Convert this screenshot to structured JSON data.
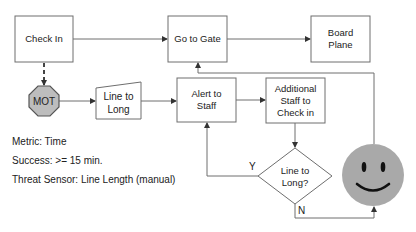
{
  "nodes": {
    "check_in": {
      "label": "Check In"
    },
    "go_to_gate": {
      "label": "Go to Gate"
    },
    "board_plane": {
      "line1": "Board",
      "line2": "Plane"
    },
    "mot": {
      "label": "MOT",
      "fill": "#bdbdbd"
    },
    "line_to_long": {
      "line1": "Line to",
      "line2": "Long"
    },
    "alert_staff": {
      "line1": "Alert to",
      "line2": "Staff"
    },
    "additional_staff": {
      "line1": "Additional",
      "line2": "Staff to",
      "line3": "Check in"
    },
    "decision": {
      "line1": "Line to",
      "line2": "Long?"
    },
    "smiley": {
      "fill": "#a9a9a9"
    }
  },
  "edges": {
    "yes_label": "Y",
    "no_label": "N"
  },
  "info": {
    "metric": "Metric: Time",
    "success": "Success: >= 15 min.",
    "threat_sensor": "Threat Sensor: Line Length (manual)"
  }
}
